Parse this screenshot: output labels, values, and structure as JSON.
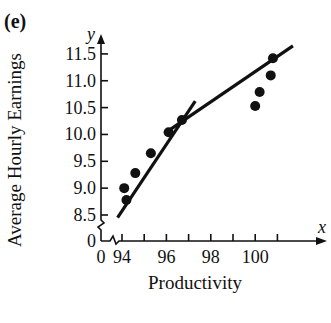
{
  "panel": {
    "label": "(e)"
  },
  "chart_data": {
    "type": "scatter",
    "title": "",
    "xlabel": "Productivity",
    "ylabel": "Average Hourly Earnings",
    "x_axis_symbol": "x",
    "y_axis_symbol": "y",
    "xlim": [
      93.5,
      102.5
    ],
    "ylim": [
      8.25,
      11.9
    ],
    "axis_breaks": {
      "x": true,
      "y": true
    },
    "x_ticks": [
      94,
      95,
      96,
      97,
      98,
      99,
      100,
      101
    ],
    "x_tick_labels": [
      "0",
      "94",
      "96",
      "98",
      "100"
    ],
    "y_ticks": [
      8.5,
      9.0,
      9.5,
      10.0,
      10.5,
      11.0,
      11.5
    ],
    "y_tick_labels": [
      "0",
      "8.5",
      "9.0",
      "9.5",
      "10.0",
      "10.5",
      "11.0",
      "11.5"
    ],
    "grid": false,
    "legend": null,
    "points": [
      {
        "x": 94.1,
        "y": 9.0
      },
      {
        "x": 94.2,
        "y": 8.78
      },
      {
        "x": 94.6,
        "y": 9.28
      },
      {
        "x": 95.3,
        "y": 9.65
      },
      {
        "x": 96.1,
        "y": 10.04
      },
      {
        "x": 96.7,
        "y": 10.27
      },
      {
        "x": 100.0,
        "y": 10.53
      },
      {
        "x": 100.2,
        "y": 10.79
      },
      {
        "x": 100.7,
        "y": 11.1
      },
      {
        "x": 100.8,
        "y": 11.42
      }
    ],
    "lines": [
      {
        "name": "segment-1",
        "x": [
          93.8,
          97.3
        ],
        "y": [
          8.45,
          10.62
        ]
      },
      {
        "name": "segment-2",
        "x": [
          95.95,
          101.7
        ],
        "y": [
          10.03,
          11.65
        ]
      }
    ]
  }
}
